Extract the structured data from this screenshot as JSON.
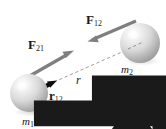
{
  "figure": {
    "name": "gravitational-force-pair-diagram",
    "background_color": "#ffffff",
    "width": 166,
    "height": 129
  },
  "bodies": [
    {
      "id": "mass-1",
      "label_base": "m",
      "label_sub": "1",
      "center_x": 29,
      "center_y": 93,
      "radius": 19,
      "fill_light": "#fbfbfb",
      "fill_mid": "#d6d6d6",
      "fill_dark": "#9a9a9a"
    },
    {
      "id": "mass-2",
      "label_base": "m",
      "label_sub": "2",
      "center_x": 140,
      "center_y": 43,
      "radius": 20,
      "fill_light": "#fbfbfb",
      "fill_mid": "#d6d6d6",
      "fill_dark": "#9a9a9a"
    }
  ],
  "vectors": [
    {
      "id": "force-21",
      "label_base": "F",
      "label_sub": "21",
      "has_vector_arrow": true,
      "color": "#808080",
      "from_x": 27,
      "from_y": 77,
      "to_x": 73,
      "to_y": 51,
      "description": "force on mass 1 due to mass 2, pointing up-right"
    },
    {
      "id": "force-12",
      "label_base": "F",
      "label_sub": "12",
      "has_vector_arrow": true,
      "color": "#808080",
      "from_x": 136,
      "from_y": 21,
      "to_x": 88,
      "to_y": 41,
      "description": "force on mass 2 due to mass 1, pointing down-left"
    },
    {
      "id": "unit-vector-r12",
      "label_base": "r",
      "label_sub": "12",
      "has_hat": true,
      "color": "#000000",
      "from_x": 31,
      "from_y": 93,
      "to_x": 56,
      "to_y": 81,
      "description": "unit vector from mass 1 toward mass 2"
    }
  ],
  "separation": {
    "id": "separation-line",
    "label": "r",
    "style": "dashed",
    "color": "#9a9a9a",
    "from_x": 54,
    "from_y": 82,
    "to_x": 140,
    "to_y": 44
  }
}
